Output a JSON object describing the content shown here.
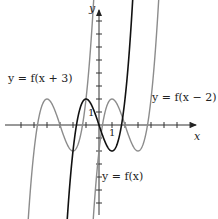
{
  "chart_data": {
    "type": "line",
    "title": "",
    "xlabel": "x",
    "ylabel": "y",
    "axis_tick_label_x": "1",
    "axis_tick_label_y": "1",
    "series": [
      {
        "name": "y = f(x)",
        "color": "#111111",
        "description": "cubic with local max near x=-1, local min near x=1, passes through origin"
      },
      {
        "name": "y = f(x + 3)",
        "color": "#8a8a8a",
        "description": "f shifted left 3 units"
      },
      {
        "name": "y = f(x - 2)",
        "color": "#8a8a8a",
        "description": "f shifted right 2 units"
      }
    ],
    "xlim": [
      -7,
      6
    ],
    "ylim": [
      -6,
      9
    ],
    "grid": false
  },
  "labels": {
    "left_curve": "y = f(x + 3)",
    "right_curve": "y = f(x − 2)",
    "center_curve": "y = f(x)",
    "x_axis": "x",
    "y_axis": "y",
    "tick_x": "1",
    "tick_y": "1"
  }
}
